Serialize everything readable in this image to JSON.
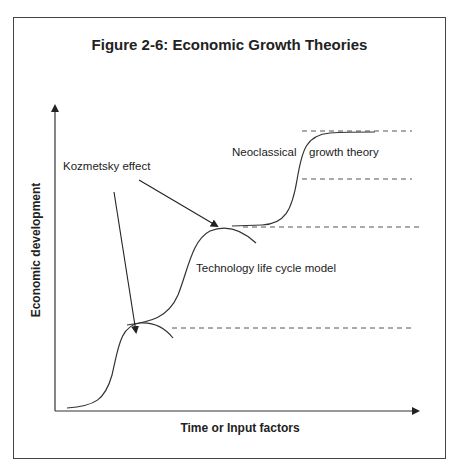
{
  "figure": {
    "title": "Figure 2-6: Economic Growth Theories",
    "x_axis_label": "Time or Input factors",
    "y_axis_label": "Economic development",
    "annotations": {
      "kozmetsky": "Kozmetsky effect",
      "neoclassical_left": "Neoclassical",
      "neoclassical_right": "growth theory",
      "tech_life_cycle": "Technology life cycle model"
    },
    "colors": {
      "line": "#333333",
      "dashed": "#555555",
      "frame": "#444444",
      "text": "#222222"
    }
  }
}
